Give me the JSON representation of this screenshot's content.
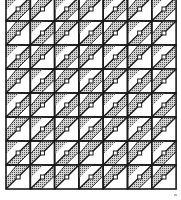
{
  "pattern": {
    "description": "Quilt block grid with diagonal shaded stripes and small square markers",
    "columns": 7,
    "rows": 8,
    "grid_origin": [
      6,
      -3
    ],
    "cell_width": 24.3,
    "cell_height": 24,
    "colors": {
      "background": "#ffffff",
      "line": "#1a1a1a",
      "shade": "#b8b8b8",
      "shade_dot": "#555555"
    }
  }
}
